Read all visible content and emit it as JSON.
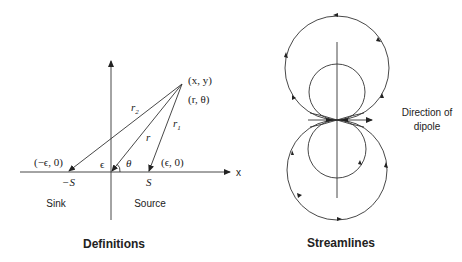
{
  "definitions": {
    "title": "Definitions",
    "axis_x_label": "x",
    "point_xy": "(x, y)",
    "point_rtheta": "(r, θ)",
    "r1": "r",
    "r1_sub": "1",
    "r2": "r",
    "r2_sub": "2",
    "r": "r",
    "theta": "θ",
    "epsilon": "ϵ",
    "neg_eps_point": "(−ϵ, 0)",
    "eps_point": "(ϵ, 0)",
    "neg_s": "−S",
    "s": "S",
    "sink": "Sink",
    "source": "Source"
  },
  "streamlines": {
    "title": "Streamlines",
    "direction_line1": "Direction of",
    "direction_line2": "dipole"
  }
}
